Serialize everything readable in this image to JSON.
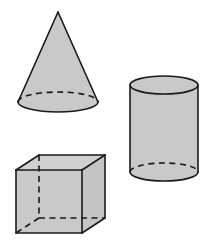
{
  "figure": {
    "background_color": "#ffffff",
    "fill_color": "#c9c9c9",
    "stroke_color": "#1a1a1a",
    "width": 208,
    "height": 248
  },
  "shapes": [
    {
      "name": "cone",
      "label": "Cone",
      "position": "top-left",
      "apex": {
        "x": 58,
        "y": 12
      },
      "base_center": {
        "x": 58,
        "y": 102
      },
      "base_radius_x": 40,
      "base_radius_y": 10,
      "hidden_edge_style": "dashed",
      "fill_color": "#c9c9c9",
      "stroke_color": "#1a1a1a"
    },
    {
      "name": "cylinder",
      "label": "Cylinder",
      "position": "right",
      "center_x": 164,
      "top_center_y": 85,
      "bottom_center_y": 172,
      "radius_x": 34,
      "radius_y": 9,
      "height": 87,
      "hidden_edge_style": "dashed",
      "fill_color": "#c9c9c9",
      "stroke_color": "#1a1a1a"
    },
    {
      "name": "cube",
      "label": "Cube",
      "position": "bottom-left",
      "front_face": {
        "left": 16,
        "top": 170,
        "right": 82,
        "bottom": 233
      },
      "depth_offset": {
        "x": 23,
        "y": -15
      },
      "hidden_edge_style": "dashed",
      "fill_color": "#c9c9c9",
      "stroke_color": "#1a1a1a"
    }
  ]
}
